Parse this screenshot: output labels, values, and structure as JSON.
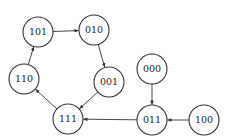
{
  "diagram": {
    "type": "state-transition-graph",
    "nodes": [
      {
        "id": "101",
        "label": "101",
        "x": 38,
        "y": 32
      },
      {
        "id": "010",
        "label": "010",
        "x": 94,
        "y": 30
      },
      {
        "id": "001",
        "label": "001",
        "x": 109,
        "y": 82
      },
      {
        "id": "110",
        "label": "110",
        "x": 24,
        "y": 79
      },
      {
        "id": "111",
        "label": "111",
        "x": 68,
        "y": 119
      },
      {
        "id": "000",
        "label": "000",
        "x": 152,
        "y": 69
      },
      {
        "id": "011",
        "label": "011",
        "x": 152,
        "y": 120
      },
      {
        "id": "100",
        "label": "100",
        "x": 204,
        "y": 120
      }
    ],
    "edges": [
      {
        "from": "101",
        "to": "010"
      },
      {
        "from": "010",
        "to": "001"
      },
      {
        "from": "001",
        "to": "111"
      },
      {
        "from": "111",
        "to": "110"
      },
      {
        "from": "110",
        "to": "101"
      },
      {
        "from": "000",
        "to": "011"
      },
      {
        "from": "100",
        "to": "011"
      },
      {
        "from": "011",
        "to": "111"
      }
    ],
    "node_radius": 15,
    "stroke_color": "#333333"
  }
}
